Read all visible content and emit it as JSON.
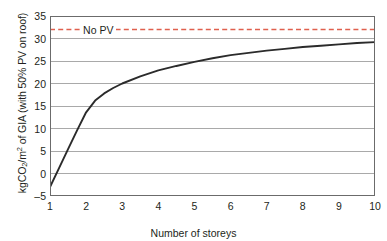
{
  "chart_data": {
    "type": "line",
    "title": "",
    "xlabel": "Number of storeys",
    "ylabel": "kgCO2/m2 of GIA (with 50% PV on roof)",
    "ylabel_parts": {
      "prefix": "kgCO",
      "sub1": "2",
      "mid": "/m",
      "sup1": "2",
      "suffix": " of GIA (with 50% PV on roof)"
    },
    "xlim": [
      1,
      10
    ],
    "ylim": [
      -5,
      35
    ],
    "xticks": [
      "1",
      "2",
      "3",
      "4",
      "5",
      "6",
      "7",
      "8",
      "9",
      "10"
    ],
    "yticks": [
      "35",
      "30",
      "25",
      "20",
      "15",
      "10",
      "5",
      "0",
      "–5"
    ],
    "grid": true,
    "legend_position": "inside-top-left",
    "series": [
      {
        "name": "With 50% PV on roof",
        "style": "solid",
        "color": "#2b2b2b",
        "x": [
          1,
          1.25,
          1.5,
          1.75,
          2,
          2.25,
          2.5,
          2.75,
          3,
          3.5,
          4,
          4.5,
          5,
          5.5,
          6,
          6.5,
          7,
          7.5,
          8,
          8.5,
          9,
          9.5,
          10
        ],
        "values": [
          -3.0,
          1.2,
          5.4,
          9.6,
          13.6,
          16.2,
          17.8,
          19.0,
          20.0,
          21.6,
          22.9,
          23.9,
          24.8,
          25.6,
          26.3,
          26.8,
          27.3,
          27.7,
          28.1,
          28.4,
          28.7,
          29.0,
          29.2
        ]
      },
      {
        "name": "No PV",
        "style": "dashed",
        "color": "#e0604e",
        "constant_value": 32,
        "label": "No PV"
      }
    ],
    "annotations": [
      {
        "text": "No PV",
        "x": 2.0,
        "y": 32
      }
    ],
    "colors": {
      "curve": "#2b2b2b",
      "no_pv_line": "#e0604e",
      "grid": "#9a9a9a",
      "axis": "#4d4d4d",
      "text": "#231f20",
      "background": "#ffffff"
    }
  }
}
